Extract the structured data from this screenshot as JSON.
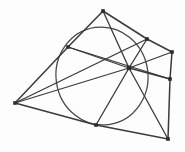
{
  "figure": {
    "background_color": "#fdfdfd",
    "ink_color": "#3a3a3f",
    "conic_color": "#45454a",
    "point_color": "#2b2b30",
    "width": 185,
    "height": 152
  },
  "chart_data": {
    "type": "scatter",
    "xlabel": "",
    "ylabel": "",
    "xlim": [
      0,
      185
    ],
    "ylim": [
      0,
      152
    ],
    "grid": false,
    "legend": "none",
    "points": [
      {
        "id": "A",
        "role": "polygon-vertex",
        "label": "top-apex",
        "x": 103,
        "y": 11
      },
      {
        "id": "B",
        "role": "polygon-vertex",
        "label": "upper-right",
        "x": 147,
        "y": 39
      },
      {
        "id": "C",
        "role": "polygon-vertex",
        "label": "right-corner",
        "x": 172,
        "y": 52
      },
      {
        "id": "D",
        "role": "polygon-vertex",
        "label": "right-mid",
        "x": 170,
        "y": 79
      },
      {
        "id": "E",
        "role": "polygon-vertex",
        "label": "bottom-right",
        "x": 168,
        "y": 139
      },
      {
        "id": "F",
        "role": "polygon-vertex",
        "label": "bottom-tangent",
        "x": 96,
        "y": 125
      },
      {
        "id": "G",
        "role": "polygon-vertex",
        "label": "left-corner",
        "x": 15,
        "y": 103
      },
      {
        "id": "H",
        "role": "polygon-vertex",
        "label": "upper-left-tangent",
        "x": 68,
        "y": 47
      },
      {
        "id": "P",
        "role": "concurrency-point",
        "label": "center-hub",
        "x": 129,
        "y": 68
      }
    ],
    "conic": {
      "shape": "ellipse",
      "cx": 102,
      "cy": 76,
      "rx": 46,
      "ry": 49,
      "rotation_deg": -8
    },
    "polygon_edges": [
      [
        "A",
        "B"
      ],
      [
        "B",
        "C"
      ],
      [
        "C",
        "D"
      ],
      [
        "D",
        "E"
      ],
      [
        "E",
        "F"
      ],
      [
        "F",
        "G"
      ],
      [
        "G",
        "H"
      ],
      [
        "H",
        "A"
      ]
    ],
    "cevians": [
      [
        "P",
        "A"
      ],
      [
        "P",
        "B"
      ],
      [
        "P",
        "C"
      ],
      [
        "P",
        "D"
      ],
      [
        "P",
        "E"
      ],
      [
        "P",
        "F"
      ],
      [
        "P",
        "G"
      ],
      [
        "P",
        "H"
      ]
    ],
    "chords": [
      [
        "H",
        "D"
      ],
      [
        "G",
        "B"
      ]
    ]
  }
}
